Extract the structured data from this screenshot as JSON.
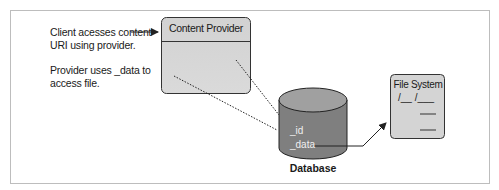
{
  "diagram": {
    "notes": {
      "client_line1": "Client acesses content",
      "client_line2": "URI using provider.",
      "provider_line1": "Provider uses _data to",
      "provider_line2": "access file."
    },
    "content_provider": {
      "title": "Content Provider"
    },
    "database": {
      "label": "Database",
      "fields": [
        "_id",
        "_data"
      ]
    },
    "file_system": {
      "title": "File System",
      "path_line": "/__ /___"
    },
    "colors": {
      "box_fill": "#d6d6d6",
      "header_fill": "#cfcfcf",
      "db_top": "#9a9a9a",
      "db_body": "#7d7d7d",
      "stroke": "#222222",
      "frame": "#bdbdbd"
    }
  }
}
